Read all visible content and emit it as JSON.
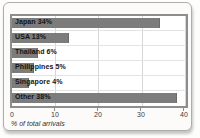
{
  "chart_data": {
    "type": "bar",
    "orientation": "horizontal",
    "title": "",
    "categories": [
      "Japan",
      "USA",
      "Thailand",
      "Philippines",
      "Singapore",
      "Other"
    ],
    "values": [
      34,
      13,
      6,
      5,
      4,
      38
    ],
    "bar_labels": [
      "Japan 34%",
      "USA 13%",
      "Thailand 6%",
      "Philippines 5%",
      "Singapore 4%",
      "Other 38%"
    ],
    "xlabel": "% of total arrivals",
    "xticks": [
      0,
      10,
      20,
      30,
      40
    ],
    "xlim": [
      0,
      40
    ],
    "grid": true,
    "legend": "none",
    "bar_color": "#7c7c7c",
    "gridline_color": "#d6d6d4",
    "plot_border_color": "#8d8d8d"
  }
}
